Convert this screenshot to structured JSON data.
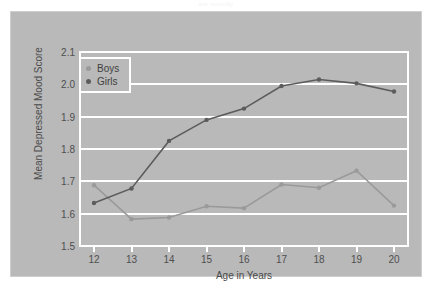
{
  "figure": {
    "top_caption": "are recently",
    "background_color": "#ffffff",
    "panel_color": "#b9b9b9",
    "grid_color": "#ffffff"
  },
  "legend": {
    "position": "upper-left-inside",
    "entries": [
      {
        "label": "Boys",
        "color": "#9a9a9a"
      },
      {
        "label": "Girls",
        "color": "#5c5c5c"
      }
    ]
  },
  "chart_data": {
    "type": "line",
    "title": "",
    "xlabel": "Age in Years",
    "ylabel": "Mean Depressed Mood Score",
    "x": [
      12,
      13,
      14,
      15,
      16,
      17,
      18,
      19,
      20
    ],
    "xtick_labels": [
      "12",
      "13",
      "14",
      "15",
      "16",
      "17",
      "18",
      "19",
      "20"
    ],
    "xlim": [
      11.6,
      20.4
    ],
    "ylim": [
      1.5,
      2.1
    ],
    "ytick_labels": [
      "1.5",
      "1.6",
      "1.7",
      "1.8",
      "1.9",
      "2.0",
      "2.1"
    ],
    "yticks": [
      1.5,
      1.6,
      1.7,
      1.8,
      1.9,
      2.0,
      2.1
    ],
    "grid": "horizontal",
    "legend_position": "upper left",
    "series": [
      {
        "name": "Boys",
        "color": "#9a9a9a",
        "marker": "circle",
        "values": [
          1.688,
          1.583,
          1.588,
          1.623,
          1.617,
          1.69,
          1.68,
          1.733,
          1.625
        ]
      },
      {
        "name": "Girls",
        "color": "#5c5c5c",
        "marker": "circle",
        "values": [
          1.633,
          1.678,
          1.825,
          1.89,
          1.925,
          1.995,
          2.015,
          2.003,
          1.978
        ]
      }
    ]
  }
}
